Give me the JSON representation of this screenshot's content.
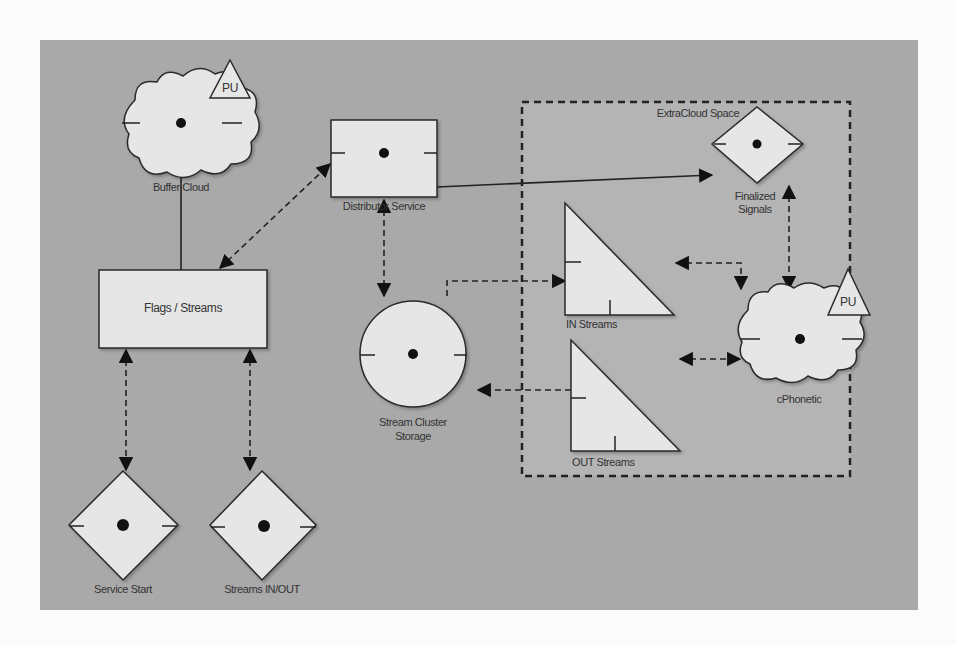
{
  "diagram": {
    "title": "",
    "group": {
      "label": "ExtraCloud Space"
    },
    "nodes": [
      {
        "id": "buffer_cloud",
        "shape": "cloud",
        "label": "Buffer Cloud",
        "badge": "PU"
      },
      {
        "id": "distributor_service",
        "shape": "rectangle",
        "label": "Distributor Service"
      },
      {
        "id": "flags_streams",
        "shape": "rectangle",
        "label": "Flags / Streams"
      },
      {
        "id": "stream_cluster_storage",
        "shape": "circle",
        "label_line1": "Stream Cluster",
        "label_line2": "Storage"
      },
      {
        "id": "in_streams",
        "shape": "right-triangle",
        "label": "IN Streams"
      },
      {
        "id": "out_streams",
        "shape": "right-triangle",
        "label": "OUT Streams"
      },
      {
        "id": "finalized_signals",
        "shape": "diamond",
        "label_line1": "Finalized",
        "label_line2": "Signals"
      },
      {
        "id": "cphonetic",
        "shape": "cloud",
        "label": "cPhonetic",
        "badge": "PU"
      },
      {
        "id": "service_start",
        "shape": "diamond",
        "label": "Service Start"
      },
      {
        "id": "streams_in_out",
        "shape": "diamond",
        "label": "Streams IN/OUT"
      }
    ],
    "edges": [
      {
        "from": "buffer_cloud",
        "to": "flags_streams",
        "style": "solid",
        "arrows": "none"
      },
      {
        "from": "flags_streams",
        "to": "distributor_service",
        "style": "dashed",
        "arrows": "both"
      },
      {
        "from": "distributor_service",
        "to": "finalized_signals",
        "style": "solid",
        "arrows": "end"
      },
      {
        "from": "distributor_service",
        "to": "stream_cluster_storage",
        "style": "dashed",
        "arrows": "both"
      },
      {
        "from": "stream_cluster_storage",
        "to": "in_streams",
        "style": "dashed",
        "arrows": "end"
      },
      {
        "from": "out_streams",
        "to": "stream_cluster_storage",
        "style": "dashed",
        "arrows": "end"
      },
      {
        "from": "in_streams",
        "to": "cphonetic",
        "style": "dashed",
        "arrows": "both"
      },
      {
        "from": "out_streams",
        "to": "cphonetic",
        "style": "dashed",
        "arrows": "both"
      },
      {
        "from": "finalized_signals",
        "to": "cphonetic",
        "style": "dashed",
        "arrows": "both"
      },
      {
        "from": "flags_streams",
        "to": "service_start",
        "style": "dashed",
        "arrows": "both"
      },
      {
        "from": "flags_streams",
        "to": "streams_in_out",
        "style": "dashed",
        "arrows": "both"
      }
    ],
    "colors": {
      "background": "#a9a9a9",
      "node_fill": "#e6e6e6",
      "stroke": "#2a2a2a",
      "group_fill": "#b4b4b4"
    }
  }
}
